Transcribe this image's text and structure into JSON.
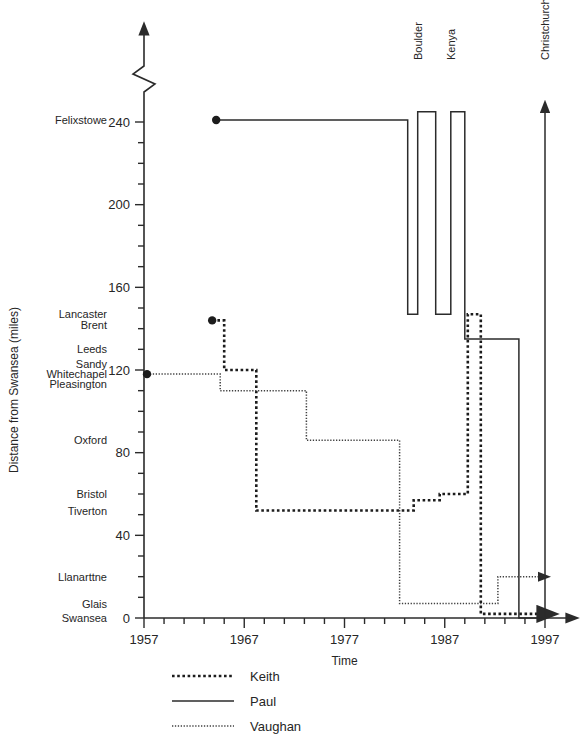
{
  "chart_data": {
    "type": "line",
    "title": "",
    "xlabel": "Time",
    "ylabel": "Distance from Swansea (miles)",
    "xlim": [
      1957,
      1997
    ],
    "ylim": [
      0,
      240
    ],
    "xticks": [
      1957,
      1967,
      1977,
      1987,
      1997
    ],
    "xtick_labels": [
      "1957",
      "1967",
      "1977",
      "1987",
      "1997"
    ],
    "xtick_minor_step": 2,
    "yticks": [
      0,
      40,
      80,
      120,
      160,
      200,
      240
    ],
    "ytick_labels": [
      "0",
      "40",
      "80",
      "120",
      "160",
      "200",
      "240"
    ],
    "ytick_minor_step": 10,
    "y_axis_break_above": 240,
    "grid": false,
    "legend_position": "bottom-left",
    "place_labels": [
      {
        "name": "Felixstowe",
        "value": 241
      },
      {
        "name": "Lancaster",
        "value": 147
      },
      {
        "name": "Brent",
        "value": 142
      },
      {
        "name": "Leeds",
        "value": 130
      },
      {
        "name": "Sandy",
        "value": 123
      },
      {
        "name": "Whitechapel",
        "value": 118
      },
      {
        "name": "Pleasington",
        "value": 113
      },
      {
        "name": "Oxford",
        "value": 86
      },
      {
        "name": "Bristol",
        "value": 60
      },
      {
        "name": "Tiverton",
        "value": 52
      },
      {
        "name": "Llanarttne",
        "value": 20
      },
      {
        "name": "Glais",
        "value": 7
      },
      {
        "name": "Swansea",
        "value": 0
      }
    ],
    "destination_arrows": [
      {
        "label": "Boulder",
        "x": 1984.3
      },
      {
        "label": "Kenya",
        "x": 1987.6
      },
      {
        "label": "Christchurch",
        "x": 1997.0
      }
    ],
    "series": [
      {
        "name": "Keith",
        "style": "thick-dotted",
        "start_marker": true,
        "points": [
          [
            1963.8,
            144
          ],
          [
            1965.0,
            144
          ],
          [
            1965.0,
            120
          ],
          [
            1968.2,
            120
          ],
          [
            1968.2,
            52
          ],
          [
            1983.9,
            52
          ],
          [
            1983.9,
            57
          ],
          [
            1986.5,
            57
          ],
          [
            1986.5,
            60
          ],
          [
            1989.3,
            60
          ],
          [
            1989.3,
            147
          ],
          [
            1990.6,
            147
          ],
          [
            1990.6,
            2
          ],
          [
            1996.4,
            2
          ]
        ],
        "end_arrow": true
      },
      {
        "name": "Paul",
        "style": "solid",
        "start_marker": true,
        "points": [
          [
            1964.2,
            241
          ],
          [
            1983.3,
            241
          ],
          [
            1983.3,
            147
          ],
          [
            1984.3,
            147
          ],
          [
            1984.3,
            245
          ],
          [
            1986.1,
            245
          ],
          [
            1986.1,
            147
          ],
          [
            1987.6,
            147
          ],
          [
            1987.6,
            245
          ],
          [
            1989.0,
            245
          ],
          [
            1989.0,
            135
          ],
          [
            1994.4,
            135
          ],
          [
            1994.4,
            0
          ],
          [
            1997.0,
            0
          ],
          [
            1997.0,
            245
          ]
        ],
        "end_arrow": true
      },
      {
        "name": "Vaughan",
        "style": "fine-dotted",
        "start_marker": true,
        "points": [
          [
            1957.3,
            118
          ],
          [
            1964.6,
            118
          ],
          [
            1964.6,
            110
          ],
          [
            1973.2,
            110
          ],
          [
            1973.2,
            86
          ],
          [
            1982.5,
            86
          ],
          [
            1982.5,
            7
          ],
          [
            1992.3,
            7
          ],
          [
            1992.3,
            20
          ],
          [
            1996.4,
            20
          ]
        ],
        "end_arrow": true
      }
    ]
  },
  "legend": {
    "items": [
      {
        "label": "Keith",
        "style": "thick-dotted"
      },
      {
        "label": "Paul",
        "style": "solid"
      },
      {
        "label": "Vaughan",
        "style": "fine-dotted"
      }
    ]
  }
}
